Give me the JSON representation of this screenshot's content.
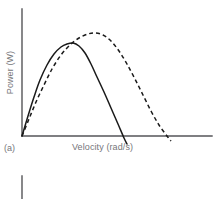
{
  "figure": {
    "panel_letter": "(a)",
    "axis_color": "#555558",
    "curve_color": "#1a1a1a",
    "text_color": "#76767a",
    "background": "#ffffff"
  },
  "chart_data": {
    "type": "line",
    "title": "",
    "xlabel": "Velocity (rad/s)",
    "ylabel": "Power (W)",
    "panel": "(a)",
    "grid": false,
    "legend": false,
    "axis_ticks": false,
    "xlim": [
      0,
      100
    ],
    "ylim": [
      0,
      100
    ],
    "axis_origin_px": [
      22,
      136
    ],
    "axis_x_end_px": [
      212,
      136
    ],
    "axis_y_top_px": [
      22,
      9
    ],
    "series": [
      {
        "name": "solid-curve",
        "style": "solid",
        "color": "#1a1a1a",
        "peak_px": [
          73,
          43
        ],
        "zero_crossing_px": [
          124,
          136
        ],
        "points_px": [
          [
            22,
            136
          ],
          [
            28,
            116
          ],
          [
            34,
            97
          ],
          [
            40,
            80
          ],
          [
            47,
            65
          ],
          [
            54,
            54
          ],
          [
            61,
            47
          ],
          [
            67,
            44
          ],
          [
            73,
            43
          ],
          [
            79,
            46
          ],
          [
            85,
            53
          ],
          [
            91,
            64
          ],
          [
            97,
            77
          ],
          [
            104,
            92
          ],
          [
            111,
            108
          ],
          [
            118,
            124
          ],
          [
            124,
            138
          ],
          [
            127,
            144
          ]
        ]
      },
      {
        "name": "dashed-curve",
        "style": "dashed",
        "color": "#1a1a1a",
        "dash_pattern": "4 3",
        "peak_px": [
          95,
          33
        ],
        "zero_crossing_px": [
          168,
          136
        ],
        "points_px": [
          [
            22,
            136
          ],
          [
            29,
            119
          ],
          [
            36,
            102
          ],
          [
            44,
            85
          ],
          [
            52,
            69
          ],
          [
            61,
            55
          ],
          [
            70,
            45
          ],
          [
            79,
            38
          ],
          [
            88,
            34
          ],
          [
            95,
            33
          ],
          [
            103,
            35
          ],
          [
            111,
            41
          ],
          [
            119,
            51
          ],
          [
            127,
            64
          ],
          [
            135,
            79
          ],
          [
            143,
            95
          ],
          [
            151,
            111
          ],
          [
            159,
            125
          ],
          [
            167,
            136
          ],
          [
            171,
            141
          ]
        ]
      }
    ]
  },
  "artifact": {
    "name": "next-figure-axis-fragment",
    "x_px": 22,
    "y_start_px": 176,
    "y_end_px": 199,
    "color": "#555558"
  }
}
